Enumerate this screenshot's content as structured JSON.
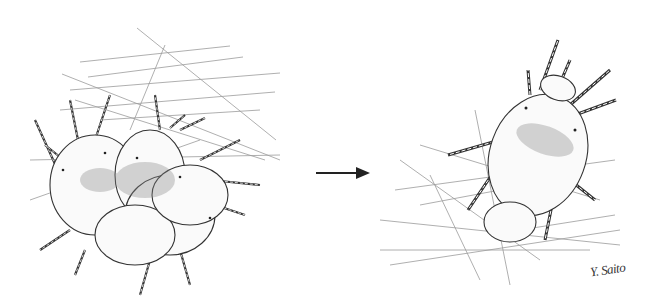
{
  "figure": {
    "left_panel": {
      "subject": "group of mites on web"
    },
    "right_panel": {
      "subject": "single mite on web"
    },
    "arrow": {
      "direction": "right"
    },
    "signature": "Y. Saito",
    "colors": {
      "ink": "#333333",
      "web": "#9a9a9a",
      "shade": "#888888",
      "background": "#ffffff"
    }
  }
}
